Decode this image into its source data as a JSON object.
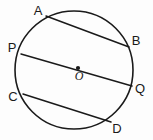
{
  "figure": {
    "kind": "circle-geometry-diagram",
    "title": "",
    "background_color": "#fdfdfd",
    "stroke_color": "#1a1a1a",
    "label_color": "#1a1a1a",
    "circle": {
      "name": "main-circle",
      "cx": 74,
      "cy": 70,
      "r": 59,
      "stroke_width": 1.6,
      "fill": "none"
    },
    "center_point": {
      "name": "center-point-o",
      "cx": 78,
      "cy": 68,
      "r": 2.1,
      "label": "O",
      "label_x": 79,
      "label_y": 80
    },
    "chords": [
      {
        "name": "chord-ab",
        "id": "AB",
        "x1": 46,
        "y1": 16,
        "x2": 129,
        "y2": 47,
        "stroke_width": 1.5
      },
      {
        "name": "chord-pq-diameter",
        "id": "PQ",
        "x1": 21,
        "y1": 54,
        "x2": 132,
        "y2": 86,
        "stroke_width": 1.5
      },
      {
        "name": "chord-cd",
        "id": "CD",
        "x1": 23,
        "y1": 94,
        "x2": 111,
        "y2": 122,
        "stroke_width": 1.5
      }
    ],
    "labels": [
      {
        "name": "label-a",
        "text": "A",
        "x": 38,
        "y": 15,
        "anchor": "middle"
      },
      {
        "name": "label-b",
        "text": "B",
        "x": 136,
        "y": 45,
        "anchor": "middle"
      },
      {
        "name": "label-p",
        "text": "P",
        "x": 12,
        "y": 52,
        "anchor": "middle"
      },
      {
        "name": "label-q",
        "text": "Q",
        "x": 140,
        "y": 93,
        "anchor": "middle"
      },
      {
        "name": "label-c",
        "text": "C",
        "x": 13,
        "y": 101,
        "anchor": "middle"
      },
      {
        "name": "label-d",
        "text": "D",
        "x": 117,
        "y": 133,
        "anchor": "middle"
      }
    ]
  }
}
